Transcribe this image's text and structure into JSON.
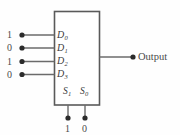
{
  "diagram": {
    "box": {
      "label": "",
      "stroke_color": "#5a5a5a",
      "fill_color": "#ffffff"
    },
    "wire_color": "#6b6b6b",
    "dot_color": "#2b2b2b",
    "data_inputs": [
      {
        "port": "D",
        "index": "0",
        "value": "1"
      },
      {
        "port": "D",
        "index": "1",
        "value": "0"
      },
      {
        "port": "D",
        "index": "2",
        "value": "1"
      },
      {
        "port": "D",
        "index": "3",
        "value": "0"
      }
    ],
    "select_inputs": [
      {
        "port": "S",
        "index": "1",
        "value": "1"
      },
      {
        "port": "S",
        "index": "0",
        "value": "0"
      }
    ],
    "output": {
      "label": "Output"
    }
  }
}
